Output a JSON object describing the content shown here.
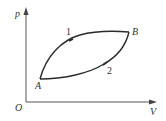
{
  "diagram": {
    "type": "p-V thermodynamic cycle",
    "axes": {
      "y_label": "p",
      "x_label": "V",
      "origin_label": "O"
    },
    "points": [
      {
        "name": "A",
        "label": "A"
      },
      {
        "name": "B",
        "label": "B"
      }
    ],
    "paths": [
      {
        "name": "path-1",
        "label": "1",
        "from": "A",
        "to": "B",
        "shape": "upper curve (convex upward)"
      },
      {
        "name": "path-2",
        "label": "2",
        "from": "A",
        "to": "B",
        "shape": "lower curve (concave)"
      }
    ],
    "colors": {
      "line": "#2a2a2a",
      "axis": "#555555",
      "text": "#333333"
    }
  }
}
